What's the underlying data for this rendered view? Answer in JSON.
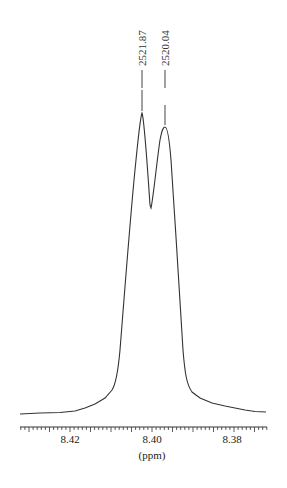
{
  "chart_data": {
    "type": "line",
    "title": "",
    "xlabel": "(ppm)",
    "ylabel": "",
    "xlim": [
      8.43,
      8.37
    ],
    "x_reversed": true,
    "grid": false,
    "x_ticks": [
      {
        "value": 8.42,
        "label": "8.42"
      },
      {
        "value": 8.4,
        "label": "8.40"
      },
      {
        "value": 8.38,
        "label": "8.38"
      }
    ],
    "peak_annotations": [
      {
        "label": "2521.87",
        "ppm": 8.4035
      },
      {
        "label": "2520.04",
        "ppm": 8.3974
      }
    ],
    "series": [
      {
        "name": "1H NMR spectrum",
        "x": [
          8.4318,
          8.425,
          8.42,
          8.416,
          8.412,
          8.409,
          8.4075,
          8.406,
          8.405,
          8.4035,
          8.4015,
          8.4005,
          8.3995,
          8.3974,
          8.3955,
          8.394,
          8.3925,
          8.391,
          8.388,
          8.384,
          8.38,
          8.376,
          8.3722
        ],
        "y": [
          0.02,
          0.03,
          0.05,
          0.1,
          0.2,
          0.45,
          0.72,
          0.9,
          0.96,
          1.0,
          0.78,
          0.69,
          0.76,
          0.95,
          0.88,
          0.68,
          0.4,
          0.2,
          0.12,
          0.08,
          0.05,
          0.03,
          0.02
        ]
      }
    ]
  },
  "annotations": {
    "peak1": "2521.87",
    "peak2": "2520.04"
  },
  "axis": {
    "label_842": "8.42",
    "label_840": "8.40",
    "label_838": "8.38",
    "unit": "(ppm)"
  }
}
